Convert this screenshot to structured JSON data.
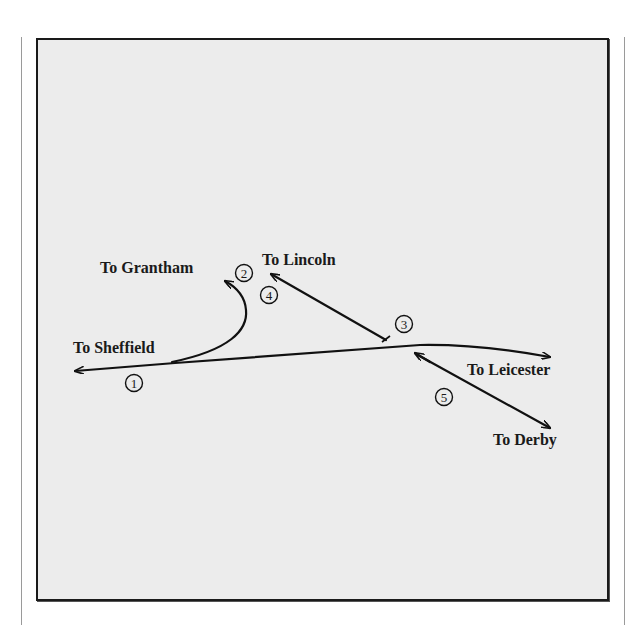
{
  "diagram": {
    "background": "#ececec",
    "line_color": "#111111",
    "destinations": {
      "sheffield": "To Sheffield",
      "grantham": "To Grantham",
      "lincoln": "To Lincoln",
      "leicester": "To Leicester",
      "derby": "To Derby"
    },
    "markers": [
      "1",
      "2",
      "3",
      "4",
      "5"
    ]
  }
}
